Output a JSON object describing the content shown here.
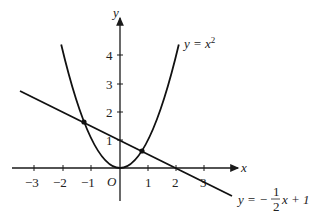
{
  "diagram": {
    "type": "function-graph",
    "axes": {
      "x_label": "x",
      "y_label": "y",
      "origin_label": "O",
      "x_ticks": [
        {
          "value": -3,
          "label": "−3"
        },
        {
          "value": -2,
          "label": "−2"
        },
        {
          "value": -1,
          "label": "−1"
        },
        {
          "value": 1,
          "label": "1"
        },
        {
          "value": 2,
          "label": "2"
        },
        {
          "value": 3,
          "label": "3"
        }
      ],
      "y_ticks": [
        {
          "value": 1,
          "label": "1"
        },
        {
          "value": 2,
          "label": "2"
        },
        {
          "value": 3,
          "label": "3"
        },
        {
          "value": 4,
          "label": "4"
        }
      ]
    },
    "curves": [
      {
        "name": "parabola",
        "equation": "y = x^2",
        "label_prefix": "y = x",
        "label_sup": "2"
      },
      {
        "name": "line",
        "equation": "y = -1/2 x + 1",
        "label_prefix": "y = −",
        "frac_num": "1",
        "frac_den": "2",
        "label_suffix": "x + 1"
      }
    ],
    "intersections": [
      {
        "x": -1.28,
        "y": 1.64
      },
      {
        "x": 0.78,
        "y": 0.61
      }
    ]
  }
}
